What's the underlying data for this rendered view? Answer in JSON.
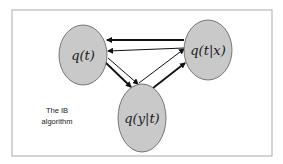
{
  "diagram": {
    "caption_lines": [
      "The IB",
      "algorithm"
    ],
    "colors": {
      "node_fill": "#c9c9c9",
      "node_stroke": "#5a5a5a",
      "edge": "#111111",
      "frame": "#b8b8b8",
      "background": "#ffffff"
    },
    "nodes": [
      {
        "id": "qt",
        "label": "q(t)"
      },
      {
        "id": "qtx",
        "label": "q(t|x)"
      },
      {
        "id": "qyt",
        "label": "q(y|t)"
      }
    ],
    "edges": [
      {
        "from": "qtx",
        "to": "qt",
        "style": "thick"
      },
      {
        "from": "qtx",
        "to": "qt",
        "style": "thin"
      },
      {
        "from": "qt",
        "to": "qyt",
        "style": "thick"
      },
      {
        "from": "qt",
        "to": "qyt",
        "style": "thin"
      },
      {
        "from": "qyt",
        "to": "qtx",
        "style": "thick"
      },
      {
        "from": "qyt",
        "to": "qtx",
        "style": "thin"
      }
    ]
  }
}
